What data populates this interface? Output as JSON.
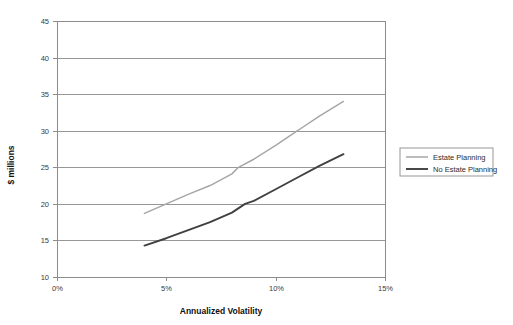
{
  "chart_data": {
    "type": "line",
    "title": "",
    "xlabel": "Annualized Volatility",
    "ylabel": "$ millions",
    "xlim": [
      0,
      15
    ],
    "ylim": [
      10,
      45
    ],
    "xticks": [
      "0%",
      "5%",
      "10%",
      "15%"
    ],
    "xtick_values": [
      0,
      5,
      10,
      15
    ],
    "yticks": [
      "10",
      "15",
      "20",
      "25",
      "30",
      "35",
      "40",
      "45"
    ],
    "ytick_values": [
      10,
      15,
      20,
      25,
      30,
      35,
      40,
      45
    ],
    "grid": "horizontal",
    "legend_position": "right-outside",
    "series": [
      {
        "name": "Estate Planning",
        "color": "#a6a6a6",
        "x": [
          4.0,
          5.0,
          6.0,
          7.0,
          8.0,
          8.3,
          9.0,
          10.0,
          11.0,
          11.1,
          12.0,
          13.1
        ],
        "values": [
          18.7,
          20.0,
          21.3,
          22.5,
          24.1,
          25.0,
          26.1,
          28.0,
          30.0,
          30.2,
          32.0,
          34.0
        ]
      },
      {
        "name": "No Estate Planning",
        "color": "#404040",
        "x": [
          4.0,
          5.0,
          6.0,
          7.0,
          8.0,
          8.6,
          9.0,
          10.0,
          11.0,
          12.0,
          13.1
        ],
        "values": [
          14.3,
          15.3,
          16.4,
          17.5,
          18.8,
          20.0,
          20.4,
          22.0,
          23.6,
          25.2,
          26.8
        ]
      }
    ]
  },
  "legend": {
    "items": [
      {
        "label": "Estate Planning",
        "color": "#a6a6a6"
      },
      {
        "label": "No Estate Planning",
        "color": "#404040"
      }
    ]
  },
  "axes": {
    "x_title": "Annualized Volatility",
    "y_title": "$ millions"
  }
}
